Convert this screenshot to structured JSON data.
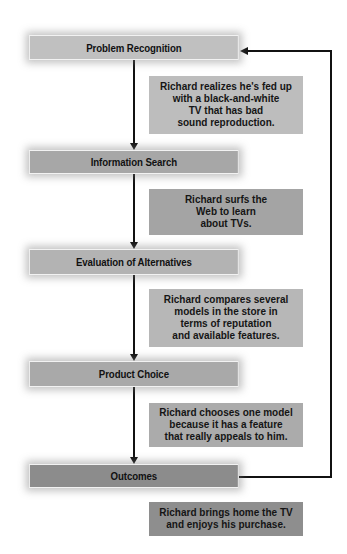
{
  "diagram": {
    "type": "flowchart",
    "stages": [
      {
        "label": "Problem Recognition",
        "color": "#c0c0c0",
        "top": 35,
        "height": 25
      },
      {
        "label": "Information Search",
        "color": "#a7a7a7",
        "top": 150,
        "height": 24
      },
      {
        "label": "Evaluation of Alternatives",
        "color": "#b3b3b3",
        "top": 249,
        "height": 26
      },
      {
        "label": "Product Choice",
        "color": "#a9a9a9",
        "top": 361,
        "height": 26
      },
      {
        "label": "Outcomes",
        "color": "#8c8c8c",
        "top": 464,
        "height": 24
      }
    ],
    "descriptions": [
      {
        "text": "Richard realizes he's fed up\nwith a black-and-white\nTV that has bad\nsound reproduction.",
        "color": "#bdbdbd",
        "top": 76,
        "height": 58
      },
      {
        "text": "Richard surfs the\nWeb to learn\nabout TVs.",
        "color": "#a4a4a4",
        "top": 189,
        "height": 46
      },
      {
        "text": "Richard compares several\nmodels in the store in\nterms of reputation\nand available features.",
        "color": "#b7b7b7",
        "top": 289,
        "height": 58
      },
      {
        "text": "Richard chooses one model\nbecause it has a feature\nthat really appeals to him.",
        "color": "#ababab",
        "top": 403,
        "height": 44
      },
      {
        "text": "Richard brings home the TV\nand enjoys his purchase.",
        "color": "#8e8e8e",
        "top": 502,
        "height": 34
      }
    ],
    "feedback_loop": {
      "from": "Outcomes",
      "to": "Problem Recognition"
    }
  }
}
